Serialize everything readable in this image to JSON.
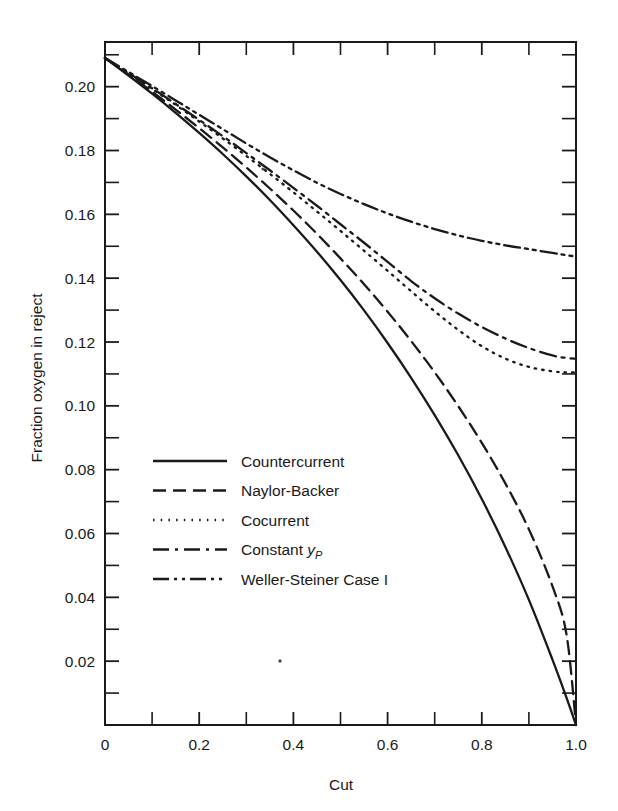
{
  "chart_data": {
    "type": "line",
    "title": "",
    "xlabel": "Cut",
    "ylabel": "Fraction oxygen in reject",
    "xlim": [
      0,
      1.0
    ],
    "ylim": [
      0,
      0.214
    ],
    "grid": false,
    "legend_position": "center-left-inside",
    "x_ticks_major": [
      "0",
      "0.2",
      "0.4",
      "0.6",
      "0.8",
      "1.0"
    ],
    "x_tick_values_major": [
      0,
      0.2,
      0.4,
      0.6,
      0.8,
      1.0
    ],
    "x_tick_values_minor": [
      0.1,
      0.3,
      0.5,
      0.7,
      0.9
    ],
    "y_ticks_major": [
      "0.02",
      "0.04",
      "0.06",
      "0.08",
      "0.10",
      "0.12",
      "0.14",
      "0.16",
      "0.18",
      "0.20"
    ],
    "y_tick_values_major": [
      0.02,
      0.04,
      0.06,
      0.08,
      0.1,
      0.12,
      0.14,
      0.16,
      0.18,
      0.2
    ],
    "y_tick_values_minor": [
      0.01,
      0.03,
      0.05,
      0.07,
      0.09,
      0.11,
      0.13,
      0.15,
      0.17,
      0.19,
      0.21
    ],
    "feed_value": 0.209,
    "x": [
      0,
      0.05,
      0.1,
      0.15,
      0.2,
      0.25,
      0.3,
      0.35,
      0.4,
      0.45,
      0.5,
      0.55,
      0.6,
      0.65,
      0.7,
      0.75,
      0.8,
      0.85,
      0.9,
      0.95,
      0.98,
      1.0
    ],
    "series": [
      {
        "name": "Countercurrent",
        "dash": "solid",
        "dasharray": "",
        "end_value": 0.0,
        "values": [
          0.209,
          0.2035,
          0.1978,
          0.1918,
          0.1855,
          0.1789,
          0.1719,
          0.1645,
          0.1566,
          0.1483,
          0.1394,
          0.1299,
          0.1197,
          0.1088,
          0.0971,
          0.0845,
          0.0708,
          0.0558,
          0.0392,
          0.0205,
          0.0085,
          0.0
        ]
      },
      {
        "name": "Naylor-Backer",
        "dash": "dashed",
        "dasharray": "13,7",
        "end_value": 0.0,
        "values": [
          0.209,
          0.2038,
          0.1984,
          0.1928,
          0.187,
          0.181,
          0.1747,
          0.1681,
          0.1612,
          0.1539,
          0.1462,
          0.1381,
          0.1295,
          0.1203,
          0.1105,
          0.0999,
          0.0884,
          0.0757,
          0.0613,
          0.0435,
          0.0282,
          0.0
        ]
      },
      {
        "name": "Cocurrent",
        "dash": "dotted",
        "dasharray": "1.5,6",
        "end_value": 0.1105,
        "values": [
          0.209,
          0.2042,
          0.1993,
          0.1943,
          0.1891,
          0.1838,
          0.1783,
          0.1727,
          0.1669,
          0.1609,
          0.1548,
          0.1486,
          0.1423,
          0.1359,
          0.1296,
          0.1238,
          0.1187,
          0.1148,
          0.1122,
          0.1108,
          0.1105,
          0.1105
        ]
      },
      {
        "name": "Constant y_P",
        "dash": "dash-dot",
        "dasharray": "16,6,3,6",
        "end_value": 0.1148,
        "values": [
          0.209,
          0.2043,
          0.1995,
          0.1946,
          0.1896,
          0.1845,
          0.1792,
          0.1738,
          0.1683,
          0.1627,
          0.1569,
          0.1511,
          0.1451,
          0.1391,
          0.1337,
          0.1289,
          0.1247,
          0.1211,
          0.1181,
          0.1158,
          0.115,
          0.1148
        ]
      },
      {
        "name": "Weller-Steiner Case I",
        "dash": "dash-dot-dot",
        "dasharray": "16,5,3,5,3,5",
        "end_value": 0.1468,
        "values": [
          0.209,
          0.2046,
          0.2002,
          0.1957,
          0.1912,
          0.1867,
          0.1822,
          0.1779,
          0.1738,
          0.1699,
          0.1664,
          0.1632,
          0.1603,
          0.1577,
          0.1554,
          0.1534,
          0.1517,
          0.1503,
          0.1491,
          0.1479,
          0.1472,
          0.1468
        ]
      }
    ]
  },
  "legend": {
    "entries": [
      {
        "label": "Countercurrent",
        "label_suffix": ""
      },
      {
        "label": "Naylor-Backer",
        "label_suffix": ""
      },
      {
        "label": "Cocurrent",
        "label_suffix": ""
      },
      {
        "label": "Constant ",
        "label_suffix": "y",
        "label_sub": "P"
      },
      {
        "label": "Weller-Steiner Case I",
        "label_suffix": ""
      }
    ]
  }
}
